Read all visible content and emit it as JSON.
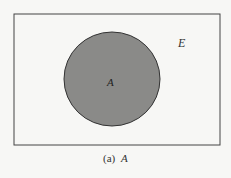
{
  "diagram": {
    "type": "venn",
    "universe_label": "E",
    "set_label": "A",
    "caption_prefix": "(a)",
    "caption_set": "A",
    "colors": {
      "background": "#f7f7f5",
      "set_fill": "#8a8a88",
      "stroke": "#333333"
    }
  }
}
